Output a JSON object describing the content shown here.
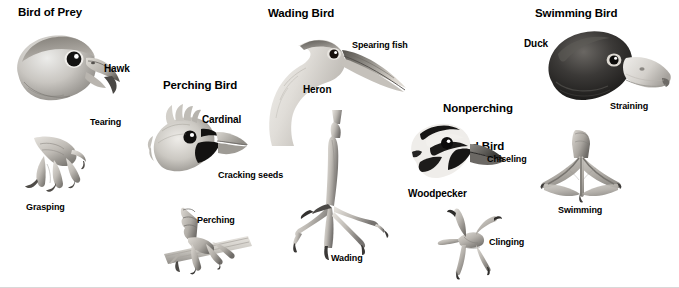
{
  "figure": {
    "background_color": "#ffffff",
    "text_color": "#000000",
    "width": 679,
    "height": 288
  },
  "groups": [
    {
      "id": "bird-of-prey",
      "heading": "Bird of Prey",
      "bird_name": "Hawk",
      "beak_function": "Tearing",
      "foot_function": "Grasping"
    },
    {
      "id": "perching-bird",
      "heading": "Perching Bird",
      "bird_name": "Cardinal",
      "beak_function": "Cracking seeds",
      "foot_function": "Perching"
    },
    {
      "id": "wading-bird",
      "heading": "Wading Bird",
      "bird_name": "Heron",
      "beak_function": "Spearing fish",
      "foot_function": "Wading"
    },
    {
      "id": "nonperching-land-bird",
      "heading_line1": "Nonperching",
      "heading_line2": "Land Bird",
      "bird_name": "Woodpecker",
      "beak_function": "Chiseling",
      "foot_function": "Clinging"
    },
    {
      "id": "swimming-bird",
      "heading": "Swimming Bird",
      "bird_name": "Duck",
      "beak_function": "Straining",
      "foot_function": "Swimming"
    }
  ],
  "illustrations": [
    {
      "name": "hawk-head-illustration",
      "subject": "hawk head with hooked beak"
    },
    {
      "name": "hawk-talon-illustration",
      "subject": "hawk talon with curved claws"
    },
    {
      "name": "cardinal-head-illustration",
      "subject": "cardinal head with crest and conical beak"
    },
    {
      "name": "perching-foot-illustration",
      "subject": "songbird foot gripping a branch"
    },
    {
      "name": "heron-head-illustration",
      "subject": "heron head and curved neck with spear beak"
    },
    {
      "name": "wading-foot-illustration",
      "subject": "heron foot with long spread toes"
    },
    {
      "name": "woodpecker-head-illustration",
      "subject": "woodpecker head with chisel beak"
    },
    {
      "name": "clinging-foot-illustration",
      "subject": "woodpecker zygodactyl foot"
    },
    {
      "name": "duck-head-illustration",
      "subject": "duck head with flat straining bill"
    },
    {
      "name": "swimming-foot-illustration",
      "subject": "duck webbed foot"
    }
  ]
}
